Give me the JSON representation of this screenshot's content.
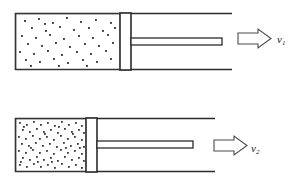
{
  "figure": {
    "type": "diagram",
    "background_color": "#ffffff",
    "line_color": "#2b2b2b",
    "dot_color": "#3a3a3a",
    "panels": [
      {
        "id": "panel-top",
        "name": "uncompressed-gas-panel",
        "cylinder": {
          "x": 15,
          "y": 13,
          "width": 217,
          "height": 57,
          "wall_thickness": 1.6
        },
        "gas_chamber": {
          "x": 16,
          "y": 14,
          "width": 104,
          "height": 55,
          "dot_count": 46,
          "density": "low"
        },
        "piston": {
          "x": 120,
          "y": 13,
          "width": 11,
          "height": 57
        },
        "rod": {
          "x": 131,
          "y": 38,
          "width": 91,
          "height": 7
        },
        "arrow": {
          "x": 238,
          "y": 29,
          "width": 33,
          "height": 19,
          "direction": "right",
          "style": "hollow-block"
        },
        "velocity_label": "v",
        "velocity_subscript": "1"
      },
      {
        "id": "panel-bottom",
        "name": "compressed-gas-panel",
        "cylinder": {
          "x": 15,
          "y": 118,
          "width": 200,
          "height": 54,
          "wall_thickness": 1.6
        },
        "gas_chamber": {
          "x": 16,
          "y": 119,
          "width": 70,
          "height": 52,
          "dot_count": 118,
          "density": "high"
        },
        "piston": {
          "x": 86,
          "y": 118,
          "width": 11,
          "height": 54
        },
        "rod": {
          "x": 97,
          "y": 141,
          "width": 96,
          "height": 7
        },
        "arrow": {
          "x": 214,
          "y": 136,
          "width": 33,
          "height": 19,
          "direction": "right",
          "style": "hollow-block"
        },
        "velocity_label": "v",
        "velocity_subscript": "2"
      }
    ]
  }
}
